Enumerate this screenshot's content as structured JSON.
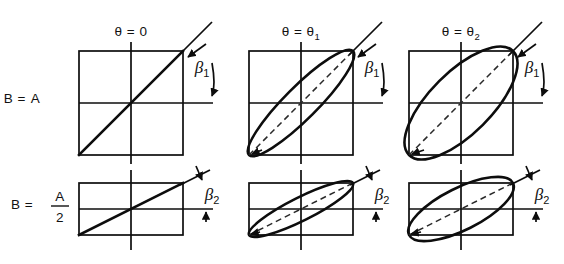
{
  "figure": {
    "background_color": "#ffffff",
    "ink_color": "#0d0d0d",
    "width": 564,
    "height": 264
  },
  "columns": [
    {
      "id": "col-theta-0",
      "label_main": "θ = 0",
      "label_sub": "",
      "theta": "0"
    },
    {
      "id": "col-theta-1",
      "label_main": "θ = θ",
      "label_sub": "1",
      "theta": "theta_1"
    },
    {
      "id": "col-theta-2",
      "label_main": "θ = θ",
      "label_sub": "2",
      "theta": "theta_2"
    }
  ],
  "rows": [
    {
      "id": "row-b-equals-a",
      "label_lead": "B =",
      "label_numer": "A",
      "label_denom": "",
      "is_fraction": false,
      "beta_label": "β",
      "beta_sub": "1"
    },
    {
      "id": "row-b-equals-a-over-2",
      "label_lead": "B =",
      "label_numer": "A",
      "label_denom": "2",
      "is_fraction": true,
      "beta_label": "β",
      "beta_sub": "2"
    }
  ],
  "cells": [
    {
      "id": "cell-r1c1",
      "row": "B = A",
      "column": "θ = 0",
      "shape": "line",
      "description": "Square box with solid 45-degree diagonal line (linear polarization)",
      "box_half_width": 52,
      "box_half_height": 52,
      "ellipse_axis_ratio": 0.0,
      "tilt_degrees": 45
    },
    {
      "id": "cell-r1c2",
      "row": "B = A",
      "column": "θ = θ₁",
      "shape": "ellipse",
      "description": "Square box with narrow inscribed ellipse tilted 45 degrees, dashed major axis",
      "box_half_width": 52,
      "box_half_height": 52,
      "ellipse_axis_ratio": 0.22,
      "tilt_degrees": 45
    },
    {
      "id": "cell-r1c3",
      "row": "B = A",
      "column": "θ = θ₂",
      "shape": "ellipse",
      "description": "Square box with wider inscribed ellipse tilted 45 degrees, dashed major axis",
      "box_half_width": 52,
      "box_half_height": 52,
      "ellipse_axis_ratio": 0.42,
      "tilt_degrees": 45
    },
    {
      "id": "cell-r2c1",
      "row": "B = A/2",
      "column": "θ = 0",
      "shape": "line",
      "description": "Half-height rectangle with solid diagonal line",
      "box_half_width": 52,
      "box_half_height": 26,
      "ellipse_axis_ratio": 0.0,
      "tilt_degrees": 26.6
    },
    {
      "id": "cell-r2c2",
      "row": "B = A/2",
      "column": "θ = θ₁",
      "shape": "ellipse",
      "description": "Half-height rectangle with narrow inscribed ellipse, dashed major axis",
      "box_half_width": 52,
      "box_half_height": 26,
      "ellipse_axis_ratio": 0.22,
      "tilt_degrees": 26.6
    },
    {
      "id": "cell-r2c3",
      "row": "B = A/2",
      "column": "θ = θ₂",
      "shape": "ellipse",
      "description": "Half-height rectangle with wider inscribed ellipse, dashed major axis",
      "box_half_width": 52,
      "box_half_height": 26,
      "ellipse_axis_ratio": 0.42,
      "tilt_degrees": 26.6
    }
  ],
  "annotations": {
    "beta_row1": "β",
    "beta_row1_sub": "1",
    "beta_row2": "β",
    "beta_row2_sub": "2",
    "theta_symbol": "θ",
    "note": "Each beta annotation marks the angle between the tangent/major-axis line and the horizontal axis"
  }
}
